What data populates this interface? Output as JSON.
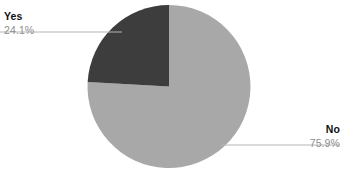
{
  "chart_data": {
    "type": "pie",
    "title": "",
    "categories": [
      "Yes",
      "No"
    ],
    "values": [
      24.1,
      75.9
    ],
    "value_unit": "%",
    "slices": [
      {
        "label": "Yes",
        "value": 24.1,
        "value_label": "24.1%",
        "color": "#3d3d3d",
        "start_angle_deg": 273.2,
        "end_angle_deg": 360.0,
        "leader_label_position": "left"
      },
      {
        "label": "No",
        "value": 75.9,
        "value_label": "75.9%",
        "color": "#a8a8a8",
        "start_angle_deg": 0.0,
        "end_angle_deg": 273.2,
        "leader_label_position": "right"
      }
    ],
    "legend": "none",
    "grid": false,
    "background_color": "#ffffff",
    "leader_line_color": "#b5b5b5",
    "start_angle_note": "first slice begins at 12 o'clock",
    "direction": "counter-clockwise for Yes, clockwise for No"
  },
  "geometry": {
    "center_x": 169,
    "center_y": 86.5,
    "radius": 81.5,
    "yes_leader_y": 32,
    "yes_leader_x_start": 0,
    "yes_leader_x_end": 122,
    "no_leader_y": 145,
    "no_leader_x_start": 222,
    "no_leader_x_end": 340
  },
  "labels": {
    "yes": {
      "category": "Yes",
      "percent": "24.1%"
    },
    "no": {
      "category": "No",
      "percent": "75.9%"
    }
  }
}
